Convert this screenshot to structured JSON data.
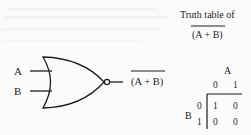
{
  "figure": {
    "type": "NOR gate diagram with truth table",
    "gate": {
      "name": "NOR",
      "inputs": [
        {
          "label": "A"
        },
        {
          "label": "B"
        }
      ],
      "output_expression": "(A + B)",
      "output_overline": true
    },
    "truth_table": {
      "title_line1": "Truth table of",
      "title_expression": "(A + B)",
      "title_overline": true,
      "column_variable": "A",
      "row_variable": "B",
      "column_headers": [
        "0",
        "1"
      ],
      "row_headers": [
        "0",
        "1"
      ],
      "cells": [
        [
          "1",
          "0"
        ],
        [
          "0",
          "0"
        ]
      ]
    }
  },
  "colors": {
    "ink": "#1e1e1e",
    "background": "#fbfbfb"
  }
}
